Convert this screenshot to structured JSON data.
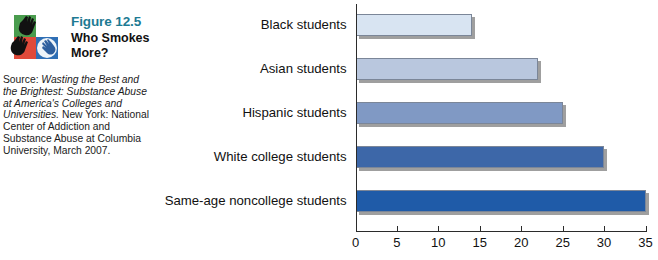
{
  "figure": {
    "number": "Figure 12.5",
    "title": "Who Smokes More?",
    "source_prefix": "Source: ",
    "source_italic_1": "Wasting the Best and the Brightest: Substance Abuse at America's Colleges and Universities.",
    "source_rest": " New York: National Center of Addiction and Substance Abuse at Columbia University, March 2007.",
    "accent_color": "#1d7a93",
    "logo_name": "hands-logo"
  },
  "chart_data": {
    "type": "bar",
    "orientation": "horizontal",
    "title": "Who Smokes More?",
    "xlabel": "",
    "ylabel": "",
    "xlim": [
      0,
      35
    ],
    "xticks": [
      0,
      5,
      10,
      15,
      20,
      25,
      30,
      35
    ],
    "grid": false,
    "legend": "none",
    "categories": [
      "Black students",
      "Asian students",
      "Hispanic students",
      "White college students",
      "Same-age noncollege students"
    ],
    "values": [
      14,
      22,
      25,
      30,
      35
    ],
    "colors": [
      "#d8e4f2",
      "#b9c7de",
      "#8099c4",
      "#3d67a8",
      "#1f5ba8"
    ],
    "border_color": "#7b8698",
    "shadow_color": "#8e8e8e"
  }
}
